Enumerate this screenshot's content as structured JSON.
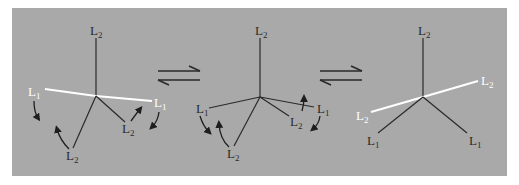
{
  "diagram": {
    "type": "chemical-equilibrium-ligand-rearrangement",
    "background_color": "#a9a9a9",
    "line_color": "#2a2a2a",
    "highlight_color": "#ffffff",
    "equilibrium_arrows": [
      {
        "x1": 158,
        "x2": 200,
        "y_top": 71,
        "y_bottom": 80
      },
      {
        "x1": 320,
        "x2": 362,
        "y_top": 71,
        "y_bottom": 80
      }
    ],
    "structures": [
      {
        "id": "structure-1",
        "center": [
          96,
          96
        ],
        "bonds": [
          {
            "to": [
              96,
              38
            ],
            "color": "dark",
            "label": "L",
            "sub": "2",
            "label_pos": [
              90,
              35
            ],
            "label_color": "dark"
          },
          {
            "to": [
              45,
              89
            ],
            "color": "white",
            "label": "L",
            "sub": "1",
            "label_pos": [
              28,
              96
            ],
            "label_color": "white"
          },
          {
            "to": [
              152,
              101
            ],
            "color": "white",
            "label": "L",
            "sub": "1",
            "label_pos": [
              154,
              107
            ],
            "label_color": "white"
          },
          {
            "to": [
              125,
              122
            ],
            "color": "dark",
            "label": "L",
            "sub": "2",
            "label_pos": [
              122,
              133
            ],
            "label_color": "dark"
          },
          {
            "to": [
              73,
              148
            ],
            "color": "dark",
            "label": "L",
            "sub": "2",
            "label_pos": [
              66,
              160
            ],
            "label_color": "dark"
          }
        ],
        "curved_arrows": [
          {
            "d": "M34 101 Q34 112 38 118",
            "head": [
              38,
              118
            ]
          },
          {
            "d": "M69 149 Q60 140 57 129",
            "head": [
              57,
              129
            ]
          },
          {
            "d": "M131 121 Q136 114 140 109",
            "head": [
              140,
              109
            ]
          },
          {
            "d": "M159 112 Q158 121 152 127",
            "head": [
              152,
              127
            ]
          }
        ]
      },
      {
        "id": "structure-2",
        "center": [
          260,
          97
        ],
        "bonds": [
          {
            "to": [
              260,
              38
            ],
            "color": "dark",
            "label": "L",
            "sub": "2",
            "label_pos": [
              255,
              35
            ],
            "label_color": "dark"
          },
          {
            "to": [
              209,
              108
            ],
            "color": "dark",
            "label": "L",
            "sub": "1",
            "label_pos": [
              196,
              113
            ],
            "label_color": "dark"
          },
          {
            "to": [
              314,
              107
            ],
            "color": "dark",
            "label": "L",
            "sub": "1",
            "label_pos": [
              317,
              113
            ],
            "label_color": "dark"
          },
          {
            "to": [
              289,
              116
            ],
            "color": "dark",
            "label": "L",
            "sub": "2",
            "label_pos": [
              290,
              126
            ],
            "label_color": "dark"
          },
          {
            "to": [
              234,
              146
            ],
            "color": "dark",
            "label": "L",
            "sub": "2",
            "label_pos": [
              227,
              158
            ],
            "label_color": "dark"
          }
        ],
        "curved_arrows": [
          {
            "d": "M200 116 Q203 126 209 132",
            "head": [
              209,
              132
            ]
          },
          {
            "d": "M229 147 Q220 139 219 124",
            "head": [
              219,
              124
            ]
          },
          {
            "d": "M302 111 Q304 104 304 98",
            "head": [
              304,
              98
            ]
          },
          {
            "d": "M320 116 Q319 124 313 129",
            "head": [
              313,
              129
            ]
          }
        ]
      },
      {
        "id": "structure-3",
        "center": [
          423,
          97
        ],
        "bonds": [
          {
            "to": [
              423,
              38
            ],
            "color": "dark",
            "label": "L",
            "sub": "2",
            "label_pos": [
              418,
              35
            ],
            "label_color": "dark"
          },
          {
            "to": [
              478,
              81
            ],
            "color": "white",
            "label": "L",
            "sub": "2",
            "label_pos": [
              481,
              85
            ],
            "label_color": "white"
          },
          {
            "to": [
              371,
              112
            ],
            "color": "white",
            "label": "L",
            "sub": "2",
            "label_pos": [
              356,
              120
            ],
            "label_color": "white"
          },
          {
            "to": [
              378,
              133
            ],
            "color": "dark",
            "label": "L",
            "sub": "1",
            "label_pos": [
              367,
              145
            ],
            "label_color": "dark"
          },
          {
            "to": [
              467,
              133
            ],
            "color": "dark",
            "label": "L",
            "sub": "1",
            "label_pos": [
              469,
              145
            ],
            "label_color": "dark"
          }
        ],
        "curved_arrows": []
      }
    ]
  }
}
